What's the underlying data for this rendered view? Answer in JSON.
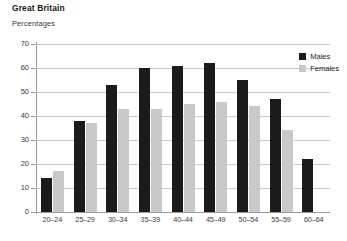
{
  "title": "Great Britain",
  "axis_caption": "Percentages",
  "legend": {
    "position": "top-right",
    "entries": [
      {
        "label": "Males",
        "color": "#1b1b1b",
        "key": "males"
      },
      {
        "label": "Females",
        "color": "#c9c9c9",
        "key": "females"
      }
    ]
  },
  "chart_data": {
    "type": "bar",
    "title": "Great Britain",
    "subtitle": "Percentages",
    "xlabel": "",
    "ylabel": "Percentages",
    "ylim": [
      0,
      70
    ],
    "yticks": [
      0,
      10,
      20,
      30,
      40,
      50,
      60,
      70
    ],
    "grid": true,
    "legend_position": "top-right",
    "categories": [
      "20–24",
      "25–29",
      "30–34",
      "35–39",
      "40–44",
      "45–49",
      "50–54",
      "55–59",
      "60–64"
    ],
    "series": [
      {
        "name": "Males",
        "color": "#1b1b1b",
        "values": [
          14,
          38,
          53,
          60,
          61,
          62,
          55,
          47,
          22
        ]
      },
      {
        "name": "Females",
        "color": "#c9c9c9",
        "values": [
          17,
          37,
          43,
          43,
          45,
          46,
          44,
          34,
          null
        ]
      }
    ]
  }
}
